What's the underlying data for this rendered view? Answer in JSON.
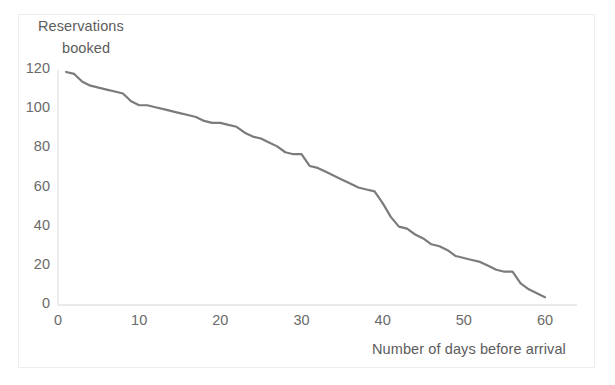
{
  "chart_data": {
    "type": "line",
    "title": "",
    "xlabel": "Number of days before arrival",
    "ylabel": "Reservations booked",
    "ylabel_line1": "Reservations",
    "ylabel_line2": "booked",
    "xlim": [
      0,
      62
    ],
    "ylim": [
      0,
      126
    ],
    "xticks": [
      0,
      10,
      20,
      30,
      40,
      50,
      60
    ],
    "yticks": [
      0,
      20,
      40,
      60,
      80,
      100,
      120
    ],
    "grid": false,
    "legend": false,
    "line_color": "#7b7b7b",
    "line_width": 2.2,
    "axis_color": "#e3e3e3",
    "x": [
      1,
      2,
      3,
      4,
      5,
      6,
      7,
      8,
      9,
      10,
      11,
      12,
      13,
      14,
      15,
      16,
      17,
      18,
      19,
      20,
      21,
      22,
      23,
      24,
      25,
      26,
      27,
      28,
      29,
      30,
      31,
      32,
      33,
      34,
      35,
      36,
      37,
      38,
      39,
      40,
      41,
      42,
      43,
      44,
      45,
      46,
      47,
      48,
      49,
      50,
      51,
      52,
      53,
      54,
      55,
      56,
      57,
      58,
      59,
      60
    ],
    "values": [
      119,
      118,
      114,
      112,
      111,
      110,
      109,
      108,
      104,
      102,
      102,
      101,
      100,
      99,
      98,
      97,
      96,
      94,
      93,
      93,
      92,
      91,
      88,
      86,
      85,
      83,
      81,
      78,
      77,
      77,
      71,
      70,
      68,
      66,
      64,
      62,
      60,
      59,
      58,
      52,
      45,
      40,
      39,
      36,
      34,
      31,
      30,
      28,
      25,
      24,
      23,
      22,
      20,
      18,
      17,
      17,
      11,
      8,
      6,
      4
    ]
  }
}
